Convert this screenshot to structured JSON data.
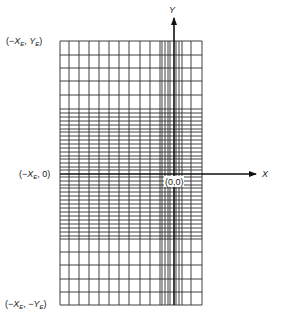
{
  "figure": {
    "type": "nonuniform-grid"
  },
  "labels": {
    "top_left": "(−X_E, Y_E)",
    "mid_left": "(−X_E, 0)",
    "bottom_left": "(−X_E, −Y_E)",
    "origin": "(0,0)",
    "x_axis": "X",
    "y_axis": "Y"
  },
  "grid": {
    "left": 60,
    "right": 202,
    "top": 41,
    "bottom": 305,
    "vertical_lines_x": [
      60,
      69,
      79,
      89,
      99,
      109,
      119,
      129,
      140,
      150,
      160,
      162,
      165,
      168,
      170,
      176,
      179,
      182,
      191,
      202
    ],
    "horizontal_lines_y": [
      41,
      55,
      68,
      81,
      95,
      109,
      113,
      117,
      121,
      125,
      129,
      132,
      136,
      140,
      144,
      148,
      152,
      156,
      159,
      163,
      167,
      170,
      177,
      181,
      185,
      188,
      192,
      196,
      200,
      204,
      208,
      212,
      216,
      220,
      224,
      228,
      232,
      236,
      239,
      252,
      265,
      279,
      292,
      305
    ]
  },
  "axes": {
    "origin": [
      174,
      174
    ],
    "x_axis_end": 256,
    "y_axis_end": 18
  },
  "colors": {
    "line": "#2a2a2a",
    "axis": "#111111",
    "background": "#ffffff"
  }
}
